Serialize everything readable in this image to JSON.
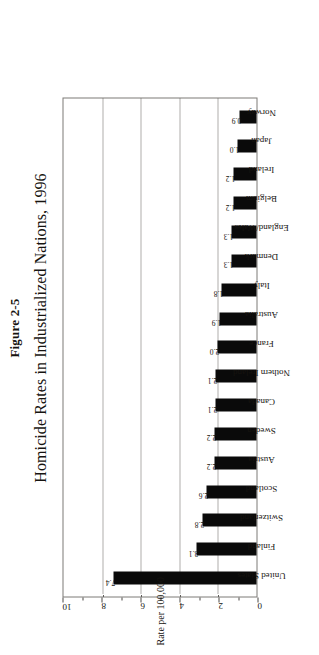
{
  "figure": {
    "number": "Figure 2-5",
    "title": "Homicide Rates in Industrialized Nations, 1996"
  },
  "axis": {
    "y_title": "Rate per 100,000",
    "ticks": [
      "0",
      "2",
      "4",
      "6",
      "8",
      "10"
    ]
  },
  "chart_data": {
    "type": "bar",
    "title": "Homicide Rates in Industrialized Nations, 1996",
    "subtitle": "Figure 2-5",
    "xlabel": "",
    "ylabel": "Rate per 100,000",
    "ylim": [
      0,
      10
    ],
    "yticks": [
      0,
      2,
      4,
      6,
      8,
      10
    ],
    "gridlines": [
      2,
      4,
      6,
      8
    ],
    "grid": true,
    "legend": false,
    "orientation": "vertical",
    "bar_color": "#0a0a0a",
    "categories": [
      "United States",
      "Finland",
      "Switzerland",
      "Scotland",
      "Austria",
      "Sweden",
      "Canada",
      "Nothern Ireland",
      "France",
      "Australia",
      "Italy",
      "Denmark",
      "England/Wales",
      "Belgium",
      "Ireland",
      "Japan",
      "Norway"
    ],
    "values": [
      7.4,
      3.1,
      2.8,
      2.6,
      2.2,
      2.2,
      2.1,
      2.1,
      2.0,
      1.9,
      1.8,
      1.3,
      1.3,
      1.2,
      1.2,
      1.0,
      0.9
    ],
    "value_labels": [
      "7.4",
      "3.1",
      "2.8",
      "2.6",
      "2.2",
      "2.2",
      "2.1",
      "2.1",
      "2.0",
      "1.9",
      "1.8",
      "1.3",
      "1.3",
      "1.2",
      "1.2",
      "1.0",
      "0.9"
    ]
  }
}
